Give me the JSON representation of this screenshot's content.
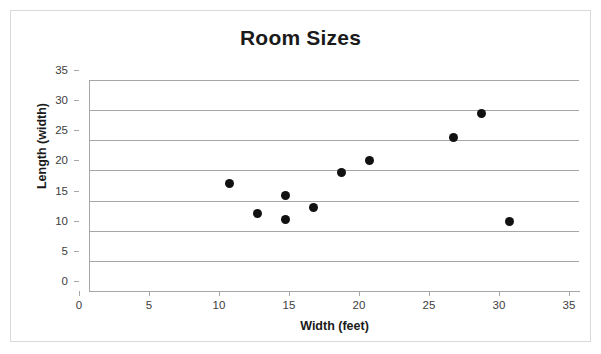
{
  "chart_data": {
    "type": "scatter",
    "title": "Room Sizes",
    "xlabel": "Width (feet)",
    "ylabel": "Length (width)",
    "xlim": [
      0,
      35
    ],
    "ylim": [
      0,
      35
    ],
    "xticks": [
      0,
      5,
      10,
      15,
      20,
      25,
      30,
      35
    ],
    "yticks": [
      0,
      5,
      10,
      15,
      20,
      25,
      30,
      35
    ],
    "grid": "horizontal",
    "legend": null,
    "marker_color": "#111111",
    "gridline_color": "#a6a6a6",
    "points": [
      {
        "x": 10,
        "y": 17.8
      },
      {
        "x": 12,
        "y": 12.8
      },
      {
        "x": 14,
        "y": 15.8
      },
      {
        "x": 14,
        "y": 11.8
      },
      {
        "x": 16,
        "y": 13.8
      },
      {
        "x": 18,
        "y": 19.7
      },
      {
        "x": 20,
        "y": 21.6
      },
      {
        "x": 26,
        "y": 25.5
      },
      {
        "x": 28,
        "y": 29.5
      },
      {
        "x": 30,
        "y": 11.5
      }
    ]
  }
}
